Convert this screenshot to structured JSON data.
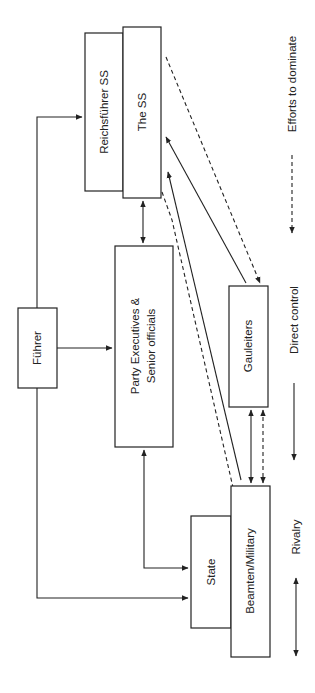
{
  "diagram": {
    "nodes": {
      "fuhrer": "Führer",
      "reichsfuhrer": "Reichsführer SS",
      "the_ss": "The SS",
      "party_line1": "Party Executives &",
      "party_line2": "Senior officials",
      "gauleiters": "Gauleiters",
      "state": "State",
      "beamten": "Beamten/Military"
    },
    "legend": {
      "rivalry": "Rivalry",
      "direct_control": "Direct control",
      "efforts": "Efforts to dominate"
    },
    "edges": [
      {
        "from": "Führer",
        "to": "Reichsführer SS",
        "type": "direct control"
      },
      {
        "from": "Führer",
        "to": "Party Executives & Senior officials",
        "type": "direct control"
      },
      {
        "from": "Führer",
        "to": "State",
        "type": "direct control"
      },
      {
        "from": "The SS",
        "to": "Party Executives & Senior officials",
        "type": "rivalry"
      },
      {
        "from": "Party Executives & Senior officials",
        "to": "State",
        "type": "rivalry"
      },
      {
        "from": "Gauleiters",
        "to": "The SS",
        "type": "direct control"
      },
      {
        "from": "Beamten/Military",
        "to": "The SS",
        "type": "direct control"
      },
      {
        "from": "The SS",
        "to": "Gauleiters",
        "type": "efforts to dominate"
      },
      {
        "from": "The SS",
        "to": "Beamten/Military",
        "type": "efforts to dominate"
      },
      {
        "from": "Gauleiters",
        "to": "Beamten/Military",
        "type": "rivalry"
      },
      {
        "from": "Gauleiters",
        "to": "Beamten/Military",
        "type": "efforts to dominate (mutual)"
      }
    ]
  }
}
